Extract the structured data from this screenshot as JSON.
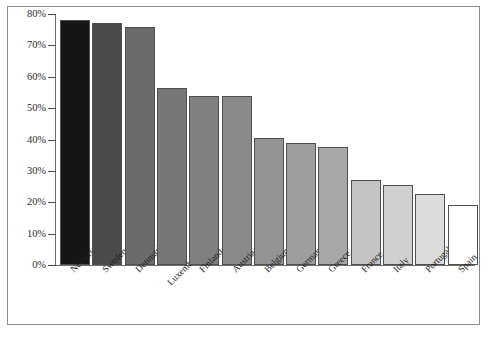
{
  "chart_data": {
    "type": "bar",
    "title": "",
    "subtitle": "",
    "xlabel": "",
    "ylabel": "",
    "ylim": [
      0,
      80
    ],
    "grid": false,
    "legend": "none",
    "y_tick_labels": [
      "80%",
      "70%",
      "60%",
      "50%",
      "40%",
      "30%",
      "20%",
      "10%",
      "0%"
    ],
    "y_tick_values": [
      80,
      70,
      60,
      50,
      40,
      30,
      20,
      10,
      0
    ],
    "categories": [
      "Netherlands",
      "Sweden",
      "Denmark",
      "Luxembourg",
      "Finland",
      "Austria",
      "Belgium",
      "Germany",
      "Greece",
      "France",
      "Italy",
      "Portugal",
      "Spain"
    ],
    "values": [
      78,
      77,
      76,
      56.5,
      54,
      54,
      40.5,
      39,
      37.5,
      27,
      25.5,
      22.5,
      19
    ],
    "bar_colors": [
      "#151515",
      "#4a4a4a",
      "#6b6b6b",
      "#777777",
      "#808080",
      "#8a8a8a",
      "#949494",
      "#9e9e9e",
      "#a8a8a8",
      "#c4c4c4",
      "#d0d0d0",
      "#dcdcdc",
      "#ffffff"
    ],
    "bar_edge_color": "#4f4f4f",
    "axis_color": "#6e6e6e",
    "frame_color": "#8d8d8d",
    "background": "#ffffff"
  }
}
